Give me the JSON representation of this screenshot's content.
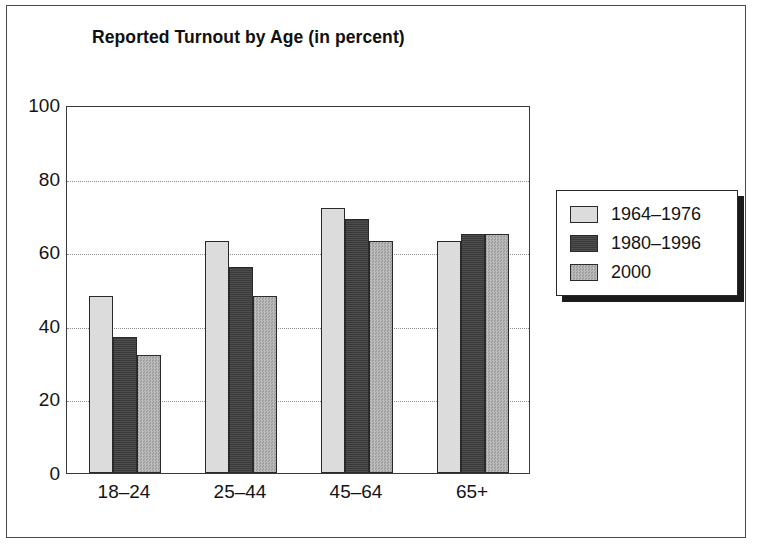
{
  "chart_data": {
    "type": "bar",
    "title": "Reported Turnout by Age (in percent)",
    "xlabel": "",
    "ylabel": "",
    "ylim": [
      0,
      100
    ],
    "yticks": [
      0,
      20,
      40,
      60,
      80,
      100
    ],
    "ytick_labels": [
      "0",
      "20",
      "40",
      "60",
      "80",
      "100"
    ],
    "grid": true,
    "legend_position": "right",
    "categories": [
      "18–24",
      "25–44",
      "45–64",
      "65+"
    ],
    "series": [
      {
        "name": "1964–1976",
        "color": "#dcdcdc",
        "values": [
          48,
          63,
          72,
          63
        ]
      },
      {
        "name": "1980–1996",
        "color": "#3a3a3a",
        "values": [
          37,
          56,
          69,
          65
        ]
      },
      {
        "name": "2000",
        "color": "#b0b0b0",
        "values": [
          32,
          48,
          63,
          65
        ]
      }
    ]
  },
  "legend": {
    "items": [
      {
        "label": "1964–1976"
      },
      {
        "label": "1980–1996"
      },
      {
        "label": "2000"
      }
    ]
  }
}
